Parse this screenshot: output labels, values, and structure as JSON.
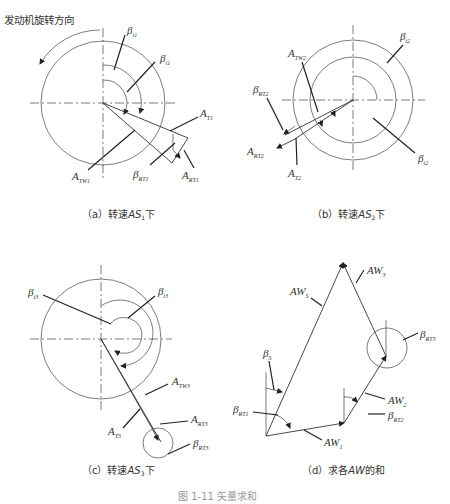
{
  "header": {
    "rotation_label": "发动机旋转方向"
  },
  "panels": [
    {
      "id": "a",
      "caption_prefix": "（a）转速",
      "caption_var": "AS",
      "caption_sub": "1",
      "caption_suffix": "下",
      "labels": {
        "beta_t1_outer": {
          "base": "β",
          "sub": "t1"
        },
        "beta_t1_inner": {
          "base": "β",
          "sub": "t1"
        },
        "A_T1": {
          "base": "A",
          "sub": "T1"
        },
        "A_TW1": {
          "base": "A",
          "sub": "TW1"
        },
        "beta_RT1": {
          "base": "β",
          "sub": "RT1"
        },
        "A_RT1": {
          "base": "A",
          "sub": "RT1"
        }
      }
    },
    {
      "id": "b",
      "caption_prefix": "（b）转速",
      "caption_var": "AS",
      "caption_sub": "2",
      "caption_suffix": "下",
      "labels": {
        "beta_t2_top": {
          "base": "β",
          "sub": "t2"
        },
        "beta_t2_bottom": {
          "base": "β",
          "sub": "t2"
        },
        "A_TW2": {
          "base": "A",
          "sub": "TW2"
        },
        "beta_RT2": {
          "base": "β",
          "sub": "RT2"
        },
        "A_RT2": {
          "base": "A",
          "sub": "RT2"
        },
        "A_T2": {
          "base": "A",
          "sub": "T2"
        }
      }
    },
    {
      "id": "c",
      "caption_prefix": "（c）转速",
      "caption_var": "AS",
      "caption_sub": "3",
      "caption_suffix": "下",
      "labels": {
        "beta_t3_left": {
          "base": "β",
          "sub": "t3"
        },
        "beta_t3_right": {
          "base": "β",
          "sub": "t3"
        },
        "A_TW3": {
          "base": "A",
          "sub": "TW3"
        },
        "A_T3": {
          "base": "A",
          "sub": "T3"
        },
        "A_RT3": {
          "base": "A",
          "sub": "RT3"
        },
        "beta_RT3": {
          "base": "β",
          "sub": "RT3"
        }
      }
    },
    {
      "id": "d",
      "caption_prefix": "（d）求各",
      "caption_var": "AW",
      "caption_suffix": "的和",
      "labels": {
        "AW_S": {
          "base": "AW",
          "sub": "S"
        },
        "AW_3": {
          "base": "AW",
          "sub": "3"
        },
        "beta_RT3": {
          "base": "β",
          "sub": "RT3"
        },
        "beta_S": {
          "base": "β",
          "sub": "S"
        },
        "beta_RT1": {
          "base": "β",
          "sub": "RT1"
        },
        "AW_2": {
          "base": "AW",
          "sub": "2"
        },
        "beta_RT2": {
          "base": "β",
          "sub": "RT2"
        },
        "AW_1": {
          "base": "AW",
          "sub": "1"
        }
      }
    }
  ],
  "figure_caption": "图 1-11  矢量求和"
}
